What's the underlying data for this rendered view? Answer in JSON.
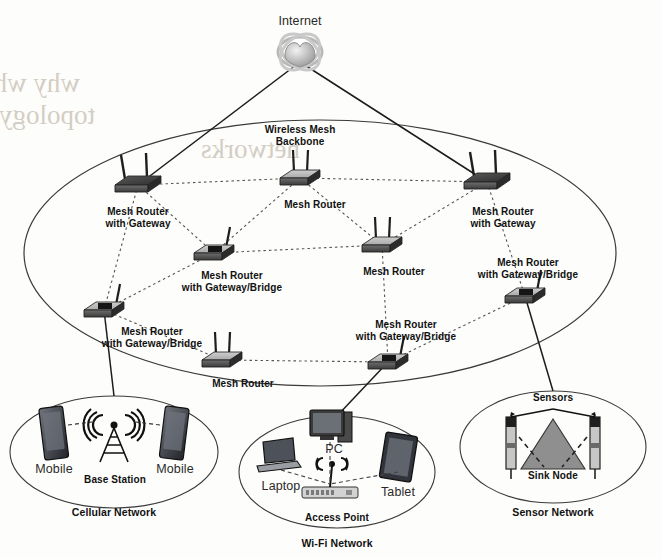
{
  "diagram": {
    "internet": {
      "label": "Internet",
      "icon": "globe-icon",
      "x": 300,
      "y": 16
    },
    "backbone": {
      "label": "Wireless Mesh\nBackbone",
      "x": 300,
      "y": 124
    },
    "routers": [
      {
        "id": "mr-gw-left",
        "label": "Mesh Router\nwith Gateway",
        "type": "gateway",
        "x": 138,
        "y": 185,
        "label_x": 138,
        "label_y": 206
      },
      {
        "id": "mr-top",
        "label": "Mesh Router",
        "type": "plain",
        "x": 300,
        "y": 178,
        "label_x": 315,
        "label_y": 199
      },
      {
        "id": "mr-gw-right",
        "label": "Mesh Router\nwith Gateway",
        "type": "gateway",
        "x": 487,
        "y": 182,
        "label_x": 503,
        "label_y": 206
      },
      {
        "id": "mr-gwb-left",
        "label": "Mesh Router\nwith Gateway/Bridge",
        "type": "gateway-bridge",
        "x": 214,
        "y": 253,
        "label_x": 232,
        "label_y": 270
      },
      {
        "id": "mr-mid",
        "label": "Mesh Router",
        "type": "plain",
        "x": 382,
        "y": 245,
        "label_x": 394,
        "label_y": 266
      },
      {
        "id": "mr-gwb-right",
        "label": "Mesh Router\nwith Gateway/Bridge",
        "type": "gateway-bridge",
        "x": 525,
        "y": 296,
        "label_x": 528,
        "label_y": 257
      },
      {
        "id": "mr-gwb-far-left",
        "label": "Mesh Router\nwith Gateway/Bridge",
        "type": "gateway-bridge",
        "x": 104,
        "y": 310,
        "label_x": 152,
        "label_y": 326
      },
      {
        "id": "mr-bottom",
        "label": "Mesh Router",
        "type": "plain",
        "x": 222,
        "y": 360,
        "label_x": 243,
        "label_y": 378
      },
      {
        "id": "mr-gwb-bot",
        "label": "Mesh Router\nwith Gateway/Bridge",
        "type": "gateway-bridge",
        "x": 388,
        "y": 362,
        "label_x": 406,
        "label_y": 319
      }
    ],
    "subnetworks": [
      {
        "id": "cellular",
        "caption": "Cellular Network",
        "caption_x": 114,
        "caption_y": 507,
        "cx": 114,
        "cy": 452,
        "rx": 104,
        "ry": 56,
        "nodes": [
          {
            "label": "Mobile",
            "icon": "smartphone-icon",
            "x": 54,
            "y": 435,
            "label_x": 54,
            "label_y": 464
          },
          {
            "label": "Base Station",
            "icon": "cell-tower-icon",
            "x": 114,
            "y": 440,
            "label_x": 115,
            "label_y": 474
          },
          {
            "label": "Mobile",
            "icon": "smartphone-icon",
            "x": 174,
            "y": 435,
            "label_x": 175,
            "label_y": 464
          }
        ]
      },
      {
        "id": "wifi",
        "caption": "Wi-Fi Network",
        "caption_x": 337,
        "caption_y": 538,
        "cx": 337,
        "cy": 472,
        "rx": 98,
        "ry": 56,
        "nodes": [
          {
            "label": "PC",
            "icon": "desktop-pc-icon",
            "x": 330,
            "y": 430,
            "label_x": 334,
            "label_y": 444
          },
          {
            "label": "Laptop",
            "icon": "laptop-icon",
            "x": 281,
            "y": 458,
            "label_x": 281,
            "label_y": 481
          },
          {
            "label": "Tablet",
            "icon": "tablet-icon",
            "x": 398,
            "y": 460,
            "label_x": 398,
            "label_y": 487
          },
          {
            "label": "Access Point",
            "icon": "wifi-ap-icon",
            "x": 330,
            "y": 492,
            "label_x": 337,
            "label_y": 512
          }
        ]
      },
      {
        "id": "sensor",
        "caption": "Sensor Network",
        "caption_x": 553,
        "caption_y": 507,
        "cx": 553,
        "cy": 447,
        "rx": 93,
        "ry": 56,
        "nodes": [
          {
            "label": "Sensors",
            "icon": "sensor-mote-icon",
            "x": 513,
            "y": 440,
            "label_x": 553,
            "label_y": 392
          },
          {
            "label": "Sink Node",
            "icon": "sink-node-icon",
            "x": 553,
            "y": 450,
            "label_x": 553,
            "label_y": 470
          }
        ]
      }
    ],
    "backbone_links": [
      [
        "mr-gw-left",
        "mr-top"
      ],
      [
        "mr-top",
        "mr-gw-right"
      ],
      [
        "mr-gw-left",
        "mr-gwb-left"
      ],
      [
        "mr-gw-left",
        "mr-gwb-far-left"
      ],
      [
        "mr-top",
        "mr-gwb-left"
      ],
      [
        "mr-top",
        "mr-mid"
      ],
      [
        "mr-gw-right",
        "mr-mid"
      ],
      [
        "mr-gw-right",
        "mr-gwb-right"
      ],
      [
        "mr-gwb-left",
        "mr-mid"
      ],
      [
        "mr-gwb-left",
        "mr-gwb-far-left"
      ],
      [
        "mr-mid",
        "mr-gwb-bot"
      ],
      [
        "mr-gwb-right",
        "mr-gwb-bot"
      ],
      [
        "mr-gwb-far-left",
        "mr-bottom"
      ],
      [
        "mr-bottom",
        "mr-gwb-bot"
      ]
    ],
    "gateway_links": [
      {
        "from": "internet",
        "to": "mr-gw-left"
      },
      {
        "from": "internet",
        "to": "mr-gw-right"
      },
      {
        "from": "mr-gwb-far-left",
        "to": "cellular"
      },
      {
        "from": "mr-gwb-bot",
        "to": "wifi"
      },
      {
        "from": "mr-gwb-right",
        "to": "sensor"
      }
    ],
    "backbone_ellipse": {
      "cx": 320,
      "cy": 253,
      "rx": 296,
      "ry": 133
    },
    "bleed_text": [
      {
        "text": "why while optimal design for the",
        "x": 80,
        "y": 92,
        "size": 27
      },
      {
        "text": "topology transmission over the",
        "x": 95,
        "y": 124,
        "size": 27
      },
      {
        "text": "networks",
        "x": 300,
        "y": 158,
        "size": 27
      }
    ]
  }
}
